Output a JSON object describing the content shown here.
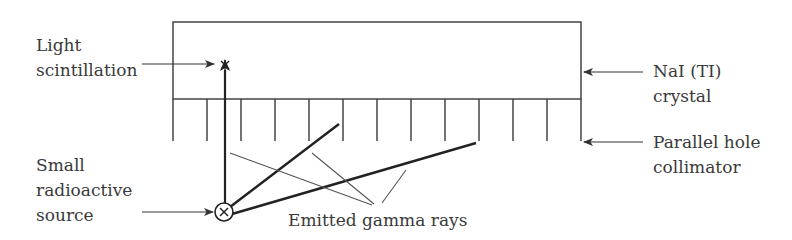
{
  "diagram": {
    "labels": {
      "light_scintillation": [
        "Light",
        "scintillation"
      ],
      "source": [
        "Small",
        "radioactive",
        "source"
      ],
      "crystal": [
        "NaI (TI)",
        "crystal"
      ],
      "collimator": [
        "Parallel hole",
        "collimator"
      ],
      "gamma_rays": "Emitted gamma rays"
    },
    "components": {
      "crystal_box": {
        "x": 173,
        "y": 22,
        "width": 408,
        "height": 77
      },
      "collimator": {
        "top": 99,
        "bottom": 141,
        "septa_x": [
          173,
          207,
          241,
          275,
          309,
          343,
          377,
          411,
          445,
          479,
          513,
          547,
          581
        ]
      },
      "source": {
        "cx": 224,
        "cy": 212,
        "r": 9
      },
      "scintillation_point": {
        "x": 225,
        "y": 65
      }
    },
    "colors": {
      "stroke": "#333333",
      "text": "#3a3a3a"
    }
  }
}
